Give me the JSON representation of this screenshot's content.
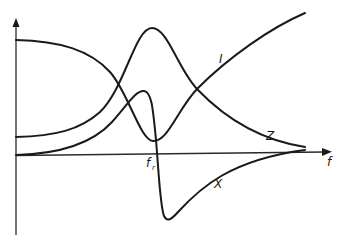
{
  "diagram": {
    "axes": {
      "x_label": "f",
      "resonance_label": "f",
      "resonance_subscript": "r"
    },
    "curves": [
      {
        "id": "I",
        "label": "I",
        "description": "current, minimum at resonance"
      },
      {
        "id": "Z",
        "label": "Z",
        "description": "impedance, maximum at resonance"
      },
      {
        "id": "X",
        "label": "X",
        "description": "reactance, changes sign at resonance"
      }
    ],
    "colors": {
      "stroke": "#1a1a1a",
      "background": "#ffffff"
    }
  }
}
